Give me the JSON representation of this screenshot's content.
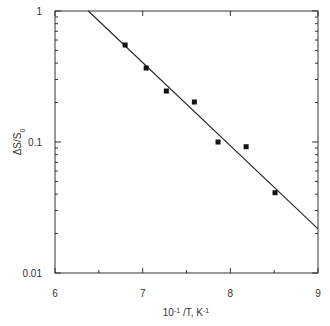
{
  "chart_data": {
    "type": "scatter",
    "title": "",
    "xlabel": "10-1/T, K-1",
    "ylabel": "ΔS/S0",
    "xlim": [
      6,
      9
    ],
    "ylim": [
      0.01,
      1
    ],
    "yscale": "log",
    "grid": false,
    "legend": null,
    "x_ticks": [
      "6",
      "7",
      "8",
      "9"
    ],
    "y_ticks": [
      "1",
      "0.1",
      "0.01"
    ],
    "series": [
      {
        "name": "data",
        "marker": "square",
        "x": [
          6.8,
          7.04,
          7.27,
          7.59,
          7.86,
          8.18,
          8.51
        ],
        "y": [
          0.55,
          0.367,
          0.245,
          0.202,
          0.1,
          0.092,
          0.041
        ]
      },
      {
        "name": "fit",
        "style": "line",
        "x": [
          6.38,
          9.0
        ],
        "y": [
          1.0,
          0.0217
        ]
      }
    ]
  }
}
